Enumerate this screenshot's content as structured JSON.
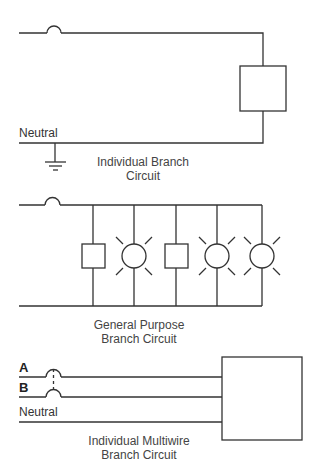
{
  "colors": {
    "line": "#333333",
    "text": "#444444",
    "background": "#ffffff"
  },
  "diagrams": [
    {
      "id": "individual",
      "labels": {
        "neutral": "Neutral"
      },
      "caption": {
        "line1": "Individual Branch",
        "line2": "Circuit"
      },
      "components": [
        "breaker",
        "load-box",
        "ground"
      ]
    },
    {
      "id": "general-purpose",
      "caption": {
        "line1": "General Purpose",
        "line2": "Branch Circuit"
      },
      "components": [
        "breaker",
        "load-box",
        "lamp",
        "load-box",
        "lamp",
        "lamp"
      ]
    },
    {
      "id": "multiwire",
      "labels": {
        "a": "A",
        "b": "B",
        "neutral": "Neutral"
      },
      "caption": {
        "line1": "Individual Multiwire",
        "line2": "Branch Circuit"
      },
      "components": [
        "tied-breaker-a",
        "tied-breaker-b",
        "load-box"
      ]
    }
  ]
}
